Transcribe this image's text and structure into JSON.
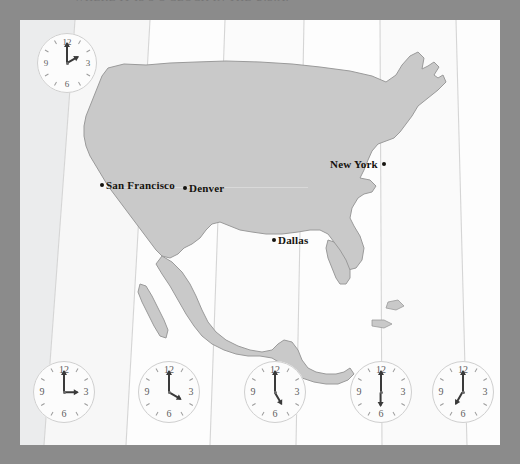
{
  "page": {
    "caption": "WHERE IT IS 3 O'CLOCK IN THE U.S.A.",
    "background_color": "#8b8b8b",
    "plate_color": "#fdfdfd",
    "land_color": "#c9c9c9",
    "land_outline_color": "#9a9a9a",
    "zone_line_color": "#d5d5d5"
  },
  "map": {
    "name": "united-states-time-zone-map",
    "cities": [
      {
        "id": "san-francisco",
        "label": "San Francisco",
        "dot_side": "left"
      },
      {
        "id": "denver",
        "label": "Denver",
        "dot_side": "left"
      },
      {
        "id": "dallas",
        "label": "Dallas",
        "dot_side": "left"
      },
      {
        "id": "new-york",
        "label": "New York",
        "dot_side": "right"
      }
    ]
  },
  "clocks": [
    {
      "id": "clock-top-left",
      "position": "top-left",
      "numerals": [
        "12",
        "3",
        "6",
        "9"
      ],
      "hour_angle": 60,
      "minute_angle": 0,
      "time": "2:00"
    },
    {
      "id": "clock-pacific",
      "position": "bottom-1",
      "numerals": [
        "12",
        "3",
        "6",
        "9"
      ],
      "hour_angle": 90,
      "minute_angle": 0,
      "time": "3:00"
    },
    {
      "id": "clock-mountain",
      "position": "bottom-2",
      "numerals": [
        "12",
        "3",
        "6",
        "9"
      ],
      "hour_angle": 120,
      "minute_angle": 0,
      "time": "4:00"
    },
    {
      "id": "clock-central",
      "position": "bottom-3",
      "numerals": [
        "12",
        "3",
        "6",
        "9"
      ],
      "hour_angle": 150,
      "minute_angle": 0,
      "time": "5:00"
    },
    {
      "id": "clock-eastern",
      "position": "bottom-4",
      "numerals": [
        "12",
        "3",
        "6",
        "9"
      ],
      "hour_angle": 180,
      "minute_angle": 0,
      "time": "6:00"
    },
    {
      "id": "clock-atlantic",
      "position": "bottom-5",
      "numerals": [
        "12",
        "3",
        "6",
        "9"
      ],
      "hour_angle": 210,
      "minute_angle": 0,
      "time": "7:00"
    }
  ]
}
